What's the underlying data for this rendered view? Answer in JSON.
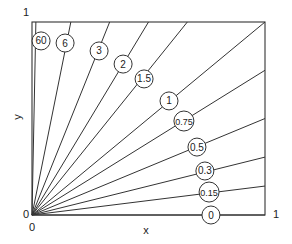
{
  "chart_data": {
    "type": "line",
    "title": "",
    "xlabel": "x",
    "ylabel": "y",
    "xlim": [
      0,
      1
    ],
    "ylim": [
      0,
      1
    ],
    "grid": false,
    "legend": "none",
    "tick_labels": {
      "x": [
        "0",
        "1"
      ],
      "y": [
        "0",
        "1"
      ]
    },
    "series": [
      {
        "name": "60",
        "slope": 60,
        "label_pos": [
          0.039,
          0.902
        ]
      },
      {
        "name": "6",
        "slope": 6,
        "label_pos": [
          0.142,
          0.891
        ]
      },
      {
        "name": "3",
        "slope": 3,
        "label_pos": [
          0.288,
          0.85
        ]
      },
      {
        "name": "2",
        "slope": 2,
        "label_pos": [
          0.391,
          0.782
        ]
      },
      {
        "name": "1.5",
        "slope": 1.5,
        "label_pos": [
          0.481,
          0.705
        ]
      },
      {
        "name": "1",
        "slope": 1,
        "label_pos": [
          0.588,
          0.591
        ]
      },
      {
        "name": "0.75",
        "slope": 0.75,
        "label_pos": [
          0.652,
          0.487
        ]
      },
      {
        "name": "0.5",
        "slope": 0.5,
        "label_pos": [
          0.708,
          0.352
        ]
      },
      {
        "name": "0.3",
        "slope": 0.3,
        "label_pos": [
          0.742,
          0.228
        ]
      },
      {
        "name": "0.15",
        "slope": 0.15,
        "label_pos": [
          0.76,
          0.119
        ]
      },
      {
        "name": "0",
        "slope": 0,
        "label_pos": [
          0.768,
          0.0
        ]
      }
    ]
  },
  "axes": {
    "x_label": "x",
    "y_label": "y",
    "x_tick_min": "0",
    "x_tick_max": "1",
    "y_tick_min": "0",
    "y_tick_max": "1"
  },
  "colors": {
    "line": "#333333",
    "frame": "#333333",
    "circle_fill": "#ffffff",
    "text": "#222222"
  }
}
